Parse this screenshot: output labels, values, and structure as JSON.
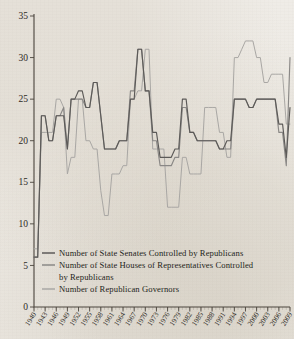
{
  "figure": {
    "background_color": "#efece7",
    "axis_color": "#4a443c"
  },
  "axes": {
    "y": {
      "label": "",
      "ticks": [
        0,
        5,
        10,
        15,
        20,
        25,
        30,
        35
      ],
      "min": 0,
      "max": 35
    },
    "x": {
      "label": "",
      "min": 1940,
      "max": 2009,
      "tick_labels": [
        "1940",
        "1943",
        "1946",
        "1949",
        "1952",
        "1955",
        "1958",
        "1961",
        "1964",
        "1967",
        "1970",
        "1973",
        "1976",
        "1979",
        "1982",
        "1985",
        "1988",
        "1991",
        "1994",
        "1997",
        "2000",
        "2003",
        "2006",
        "2009"
      ],
      "minor_tick_interval": 1
    }
  },
  "legend": {
    "position": "bottom-left-inside",
    "entries": [
      {
        "label": "Number of State Senates Controlled by Republicans",
        "color": "#5c5a58"
      },
      {
        "label": "Number of State Houses of Representatives Controlled",
        "label2": "by Republicans",
        "color": "#8a8886"
      },
      {
        "label": "Number of Republican Governors",
        "color": "#a9a7a4"
      }
    ]
  },
  "chart_data": {
    "type": "line",
    "title": "",
    "xlabel": "",
    "ylabel": "",
    "xlim": [
      1940,
      2009
    ],
    "ylim": [
      0,
      35
    ],
    "grid": false,
    "legend_position": "bottom-left",
    "x": [
      1940,
      1941,
      1942,
      1943,
      1944,
      1945,
      1946,
      1947,
      1948,
      1949,
      1950,
      1951,
      1952,
      1953,
      1954,
      1955,
      1956,
      1957,
      1958,
      1959,
      1960,
      1961,
      1962,
      1963,
      1964,
      1965,
      1966,
      1967,
      1968,
      1969,
      1970,
      1971,
      1972,
      1973,
      1974,
      1975,
      1976,
      1977,
      1978,
      1979,
      1980,
      1981,
      1982,
      1983,
      1984,
      1985,
      1986,
      1987,
      1988,
      1989,
      1990,
      1991,
      1992,
      1993,
      1994,
      1995,
      1996,
      1997,
      1998,
      1999,
      2000,
      2001,
      2002,
      2003,
      2004,
      2005,
      2006,
      2007,
      2008,
      2009
    ],
    "series": [
      {
        "name": "Number of State Senates Controlled by Republicans",
        "color": "#5c5a58",
        "values": [
          6,
          6,
          23,
          23,
          20,
          20,
          23,
          23,
          23,
          19,
          25,
          25,
          26,
          26,
          24,
          24,
          27,
          27,
          23,
          19,
          19,
          19,
          19,
          20,
          20,
          20,
          25,
          25,
          31,
          31,
          26,
          26,
          21,
          21,
          18,
          18,
          18,
          18,
          19,
          19,
          25,
          25,
          21,
          21,
          20,
          20,
          20,
          20,
          20,
          20,
          19,
          19,
          20,
          20,
          25,
          25,
          25,
          25,
          24,
          24,
          25,
          25,
          25,
          25,
          25,
          25,
          22,
          22,
          18,
          24
        ]
      },
      {
        "name": "Number of State Houses of Representatives Controlled by Republicans",
        "color": "#8a8886",
        "values": [
          6,
          6,
          23,
          23,
          20,
          20,
          23,
          23,
          24,
          19,
          25,
          25,
          25,
          25,
          24,
          24,
          27,
          27,
          23,
          19,
          19,
          19,
          19,
          20,
          20,
          20,
          26,
          26,
          31,
          31,
          26,
          26,
          20,
          20,
          17,
          17,
          17,
          17,
          18,
          18,
          24,
          24,
          21,
          21,
          20,
          20,
          20,
          20,
          20,
          20,
          19,
          19,
          19,
          19,
          25,
          25,
          25,
          25,
          24,
          24,
          25,
          25,
          25,
          25,
          25,
          25,
          21,
          21,
          17,
          30
        ]
      },
      {
        "name": "Number of Republican Governors",
        "color": "#a9a7a4",
        "values": [
          7,
          7,
          21,
          21,
          21,
          21,
          25,
          25,
          24,
          16,
          18,
          18,
          25,
          25,
          20,
          20,
          19,
          19,
          14,
          11,
          11,
          16,
          16,
          16,
          17,
          17,
          25,
          25,
          26,
          26,
          31,
          31,
          19,
          19,
          19,
          19,
          12,
          12,
          12,
          12,
          18,
          18,
          16,
          16,
          16,
          16,
          24,
          24,
          24,
          24,
          21,
          21,
          18,
          18,
          30,
          30,
          31,
          32,
          32,
          32,
          30,
          30,
          27,
          27,
          28,
          28,
          28,
          28,
          22,
          22
        ]
      }
    ]
  }
}
